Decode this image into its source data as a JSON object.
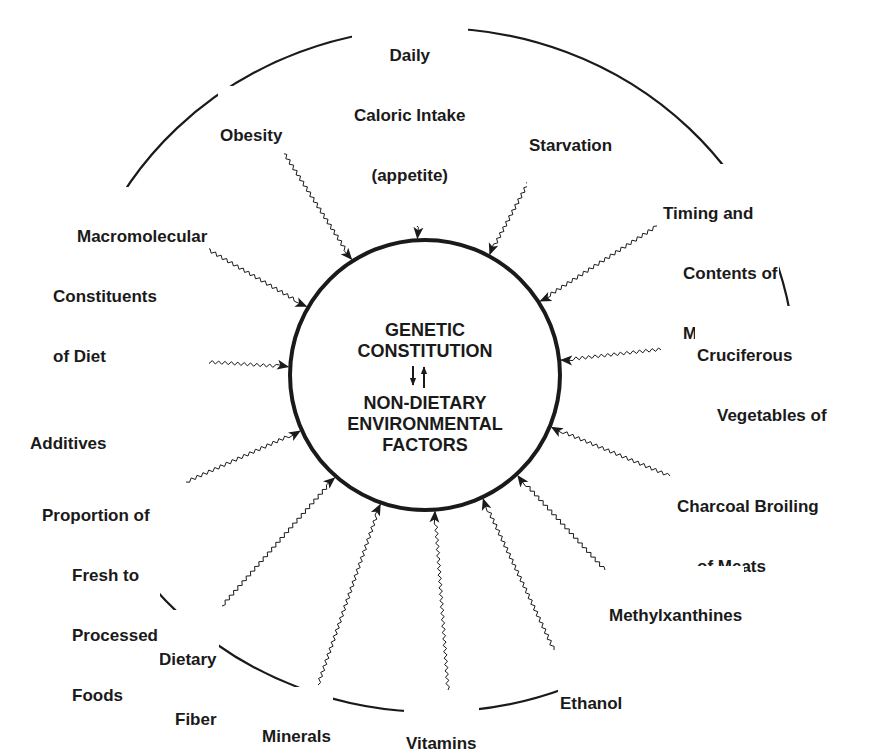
{
  "diagram": {
    "colors": {
      "ink": "#1a1a1a",
      "background": "#ffffff"
    },
    "center": {
      "top_lines": [
        "GENETIC",
        "CONSTITUTION"
      ],
      "bottom_lines": [
        "NON-DIETARY",
        "ENVIRONMENTAL",
        "FACTORS"
      ],
      "interaction_arrows": "bidirectional"
    },
    "factors": [
      {
        "id": "daily-caloric-intake",
        "lines": [
          "Daily",
          "Caloric Intake",
          "(appetite)"
        ]
      },
      {
        "id": "starvation",
        "lines": [
          "Starvation"
        ]
      },
      {
        "id": "timing-contents-meals",
        "lines": [
          "Timing and",
          "Contents of",
          "Meals"
        ]
      },
      {
        "id": "cruciferous-vegetables",
        "lines": [
          "Cruciferous",
          "Vegetables of",
          "the Brassica",
          "genus"
        ],
        "italic_word": "Brassica"
      },
      {
        "id": "charcoal-broiling",
        "lines": [
          "Charcoal Broiling",
          "of Meats"
        ]
      },
      {
        "id": "methylxanthines",
        "lines": [
          "Methylxanthines"
        ]
      },
      {
        "id": "ethanol",
        "lines": [
          "Ethanol"
        ]
      },
      {
        "id": "vitamins",
        "lines": [
          "Vitamins"
        ]
      },
      {
        "id": "minerals",
        "lines": [
          "Minerals"
        ]
      },
      {
        "id": "dietary-fiber",
        "lines": [
          "Dietary",
          "Fiber"
        ]
      },
      {
        "id": "proportion-fresh-processed",
        "lines": [
          "Proportion of",
          "Fresh to",
          "Processed",
          "Foods"
        ]
      },
      {
        "id": "food-additives",
        "lines": [
          "Food",
          "Additives"
        ]
      },
      {
        "id": "macromolecular-constituents",
        "lines": [
          "Macromolecular",
          "Constituents",
          "of Diet"
        ]
      },
      {
        "id": "obesity",
        "lines": [
          "Obesity"
        ]
      }
    ]
  }
}
